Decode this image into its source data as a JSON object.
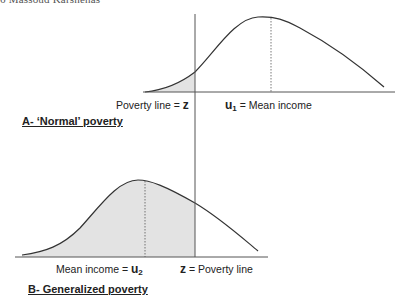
{
  "header": {
    "running_head": "6   Massoud Karshenas"
  },
  "panel_a": {
    "title": "A- ‘Normal’ poverty",
    "poverty_label_prefix": "Poverty line = ",
    "poverty_symbol": "z",
    "mean_symbol": "u",
    "mean_subscript": "1",
    "mean_label_suffix": " = Mean income"
  },
  "panel_b": {
    "title": "B- Generalized poverty",
    "mean_label_prefix": "Mean income = ",
    "mean_symbol": "u",
    "mean_subscript": "2",
    "poverty_symbol": "z",
    "poverty_label_suffix": " = Poverty line"
  },
  "colors": {
    "line": "#333333",
    "shade": "#e3e3e3",
    "text": "#222222"
  }
}
